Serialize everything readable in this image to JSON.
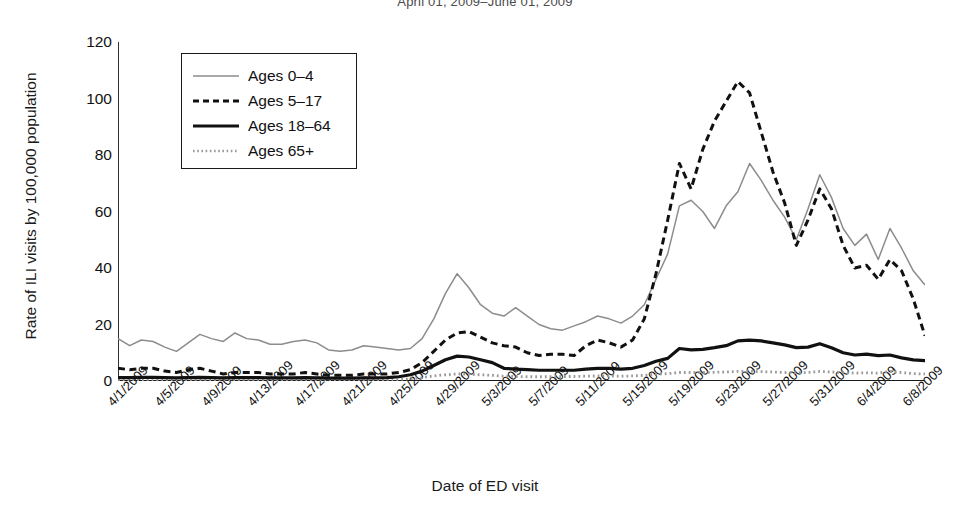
{
  "chart_data": {
    "type": "line",
    "title": "April 01, 2009–June 01, 2009",
    "xlabel": "Date of ED visit",
    "ylabel": "Rate of ILI visits by 100,000 population",
    "ylim": [
      0,
      120
    ],
    "yticks": [
      0,
      20,
      40,
      60,
      80,
      100,
      120
    ],
    "grid": false,
    "legend_position": "upper-left-inside",
    "x": [
      "4/1/2009",
      "4/2/2009",
      "4/3/2009",
      "4/4/2009",
      "4/5/2009",
      "4/6/2009",
      "4/7/2009",
      "4/8/2009",
      "4/9/2009",
      "4/10/2009",
      "4/11/2009",
      "4/12/2009",
      "4/13/2009",
      "4/14/2009",
      "4/15/2009",
      "4/16/2009",
      "4/17/2009",
      "4/18/2009",
      "4/19/2009",
      "4/20/2009",
      "4/21/2009",
      "4/22/2009",
      "4/23/2009",
      "4/24/2009",
      "4/25/2009",
      "4/26/2009",
      "4/27/2009",
      "4/28/2009",
      "4/29/2009",
      "4/30/2009",
      "5/1/2009",
      "5/2/2009",
      "5/3/2009",
      "5/4/2009",
      "5/5/2009",
      "5/6/2009",
      "5/7/2009",
      "5/8/2009",
      "5/9/2009",
      "5/10/2009",
      "5/11/2009",
      "5/12/2009",
      "5/13/2009",
      "5/14/2009",
      "5/15/2009",
      "5/16/2009",
      "5/17/2009",
      "5/18/2009",
      "5/19/2009",
      "5/20/2009",
      "5/21/2009",
      "5/22/2009",
      "5/23/2009",
      "5/24/2009",
      "5/25/2009",
      "5/26/2009",
      "5/27/2009",
      "5/28/2009",
      "5/29/2009",
      "5/30/2009",
      "5/31/2009",
      "6/1/2009",
      "6/2/2009",
      "6/3/2009",
      "6/4/2009",
      "6/5/2009",
      "6/6/2009",
      "6/7/2009",
      "6/8/2009",
      "6/9/2009"
    ],
    "xtick_labels": [
      "4/1/2009",
      "4/5/2009",
      "4/9/2009",
      "4/13/2009",
      "4/17/2009",
      "4/21/2009",
      "4/25/2009",
      "4/29/2009",
      "5/3/2009",
      "5/7/2009",
      "5/11/2009",
      "5/15/2009",
      "5/19/2009",
      "5/23/2009",
      "5/27/2009",
      "5/31/2009",
      "6/4/2009",
      "6/8/2009"
    ],
    "series": [
      {
        "name": "Ages 0–4",
        "style": "thin-solid-gray",
        "color": "#8c8c8c",
        "values": [
          15,
          12.5,
          14.5,
          14,
          12,
          10.5,
          13.5,
          16.5,
          15,
          14,
          17,
          15,
          14.5,
          13,
          13,
          14,
          14.5,
          13.5,
          11,
          10.5,
          11,
          12.5,
          12,
          11.5,
          11,
          11.5,
          15,
          22,
          31,
          38,
          33,
          27,
          24,
          23,
          26,
          23,
          20,
          18.5,
          18,
          19.5,
          21,
          23,
          22,
          20.5,
          23,
          27,
          36,
          45,
          62,
          64,
          60,
          54,
          62,
          67,
          77,
          71,
          64,
          58,
          50,
          61,
          73,
          65,
          54,
          48,
          52,
          43,
          54,
          47,
          39,
          34
        ]
      },
      {
        "name": "Ages 5–17",
        "style": "dashed-black",
        "color": "#111111",
        "values": [
          4.5,
          4,
          4.5,
          4.5,
          3.5,
          3,
          4,
          4.5,
          3.5,
          2.5,
          3,
          3,
          3,
          2.5,
          2.5,
          2.5,
          3,
          2.5,
          2,
          2,
          2,
          2.5,
          2.5,
          2.5,
          3,
          4,
          6.5,
          10.5,
          14.5,
          17,
          17.5,
          15.5,
          13.5,
          12.5,
          12,
          10,
          9,
          9.5,
          9.5,
          9,
          12.5,
          14.5,
          13.5,
          12,
          14.5,
          22,
          38,
          57,
          77,
          68,
          82,
          92,
          99,
          106,
          102,
          88,
          74,
          63,
          48,
          57,
          68,
          61,
          48,
          40,
          41,
          36,
          43,
          39,
          29,
          16
        ]
      },
      {
        "name": "Ages 18–64",
        "style": "thick-solid-black",
        "color": "#111111",
        "values": [
          1.2,
          1.2,
          1.3,
          1.3,
          1.2,
          1.1,
          1.2,
          1.3,
          1.2,
          1.1,
          1.2,
          1.2,
          1.2,
          1.1,
          1.1,
          1.1,
          1.2,
          1.1,
          1.0,
          1.0,
          1.0,
          1.1,
          1.1,
          1.2,
          1.5,
          2.2,
          3.5,
          5.5,
          7.5,
          8.8,
          8.5,
          7.5,
          6.5,
          4.5,
          4.2,
          4.0,
          3.8,
          3.8,
          3.8,
          3.8,
          4.2,
          4.5,
          4.5,
          4.2,
          4.5,
          5.5,
          7.0,
          8.0,
          11.5,
          11.0,
          11.2,
          11.8,
          12.5,
          14.2,
          14.5,
          14.2,
          13.5,
          12.8,
          11.8,
          12.0,
          13.2,
          11.8,
          10.0,
          9.2,
          9.5,
          9.0,
          9.2,
          8.2,
          7.5,
          7.2
        ]
      },
      {
        "name": "Ages 65+",
        "style": "dotted-gray",
        "color": "#9a9a9a",
        "values": [
          0.3,
          0.3,
          0.3,
          0.3,
          0.3,
          0.3,
          0.3,
          0.3,
          0.3,
          0.3,
          0.3,
          0.3,
          0.3,
          0.3,
          0.3,
          0.3,
          0.3,
          0.3,
          0.3,
          0.3,
          0.3,
          0.3,
          0.3,
          0.4,
          0.5,
          0.8,
          1.2,
          1.8,
          2.2,
          2.5,
          2.4,
          2.2,
          2.0,
          1.7,
          1.6,
          1.5,
          1.5,
          1.5,
          1.6,
          1.6,
          1.7,
          1.8,
          1.8,
          1.7,
          1.8,
          2.0,
          2.4,
          2.6,
          3.0,
          3.0,
          3.0,
          3.1,
          3.2,
          3.4,
          3.4,
          3.3,
          3.2,
          3.0,
          2.9,
          3.0,
          3.4,
          3.2,
          3.0,
          2.8,
          2.9,
          2.8,
          3.4,
          3.0,
          2.6,
          2.5
        ]
      }
    ]
  }
}
